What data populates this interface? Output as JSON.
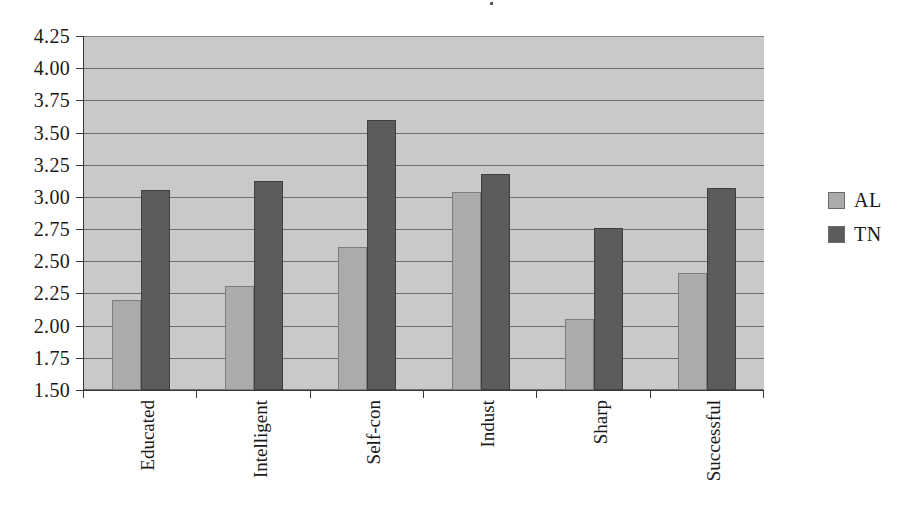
{
  "chart_data": {
    "type": "bar",
    "title": "",
    "xlabel": "",
    "ylabel": "",
    "categories": [
      "Educated",
      "Intelligent",
      "Self-con",
      "Indust",
      "Sharp",
      "Successful"
    ],
    "series": [
      {
        "name": "AL",
        "color": "#ababab",
        "values": [
          2.2,
          2.31,
          2.61,
          3.04,
          2.05,
          2.41
        ]
      },
      {
        "name": "TN",
        "color": "#5c5c5c",
        "values": [
          3.05,
          3.12,
          3.6,
          3.18,
          2.76,
          3.07
        ]
      }
    ],
    "ylim": [
      1.5,
      4.25
    ],
    "ytick_step": 0.25,
    "ytick_labels": [
      "4.25",
      "4.00",
      "3.75",
      "3.50",
      "3.25",
      "3.00",
      "2.75",
      "2.50",
      "2.25",
      "2.00",
      "1.75",
      "1.50"
    ],
    "grid": true,
    "legend_position": "right",
    "plot_background": "#c9c9c9",
    "gridline_color": "#6e6e6e",
    "axis_color": "#3a3a3a"
  },
  "legend": {
    "items": [
      {
        "label": "AL",
        "swatch": "series-al"
      },
      {
        "label": "TN",
        "swatch": "series-tn"
      }
    ]
  }
}
